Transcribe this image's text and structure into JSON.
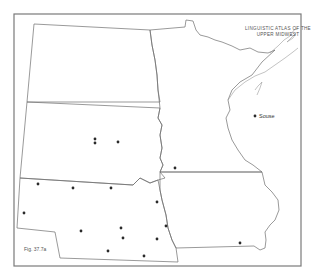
{
  "map": {
    "title_line1": "LINGUISTIC ATLAS OF THE",
    "title_line2": "UPPER MIDWEST",
    "figure_label": "Fig. 37.7a",
    "place_labels": [
      {
        "name": "Souse",
        "x": 255,
        "y": 116
      }
    ],
    "states": [
      "North Dakota",
      "Minnesota",
      "South Dakota",
      "Nebraska",
      "Iowa"
    ],
    "dot_color": "#2a2a2a",
    "dots": [
      {
        "x": 95,
        "y": 139
      },
      {
        "x": 95,
        "y": 143
      },
      {
        "x": 118,
        "y": 142
      },
      {
        "x": 38,
        "y": 184
      },
      {
        "x": 73,
        "y": 188
      },
      {
        "x": 111,
        "y": 188
      },
      {
        "x": 24,
        "y": 213
      },
      {
        "x": 157,
        "y": 202
      },
      {
        "x": 81,
        "y": 231
      },
      {
        "x": 121,
        "y": 228
      },
      {
        "x": 123,
        "y": 238
      },
      {
        "x": 166,
        "y": 226
      },
      {
        "x": 157,
        "y": 239
      },
      {
        "x": 108,
        "y": 251
      },
      {
        "x": 144,
        "y": 256
      },
      {
        "x": 175,
        "y": 168
      },
      {
        "x": 240,
        "y": 243
      },
      {
        "x": 255,
        "y": 116
      }
    ]
  }
}
